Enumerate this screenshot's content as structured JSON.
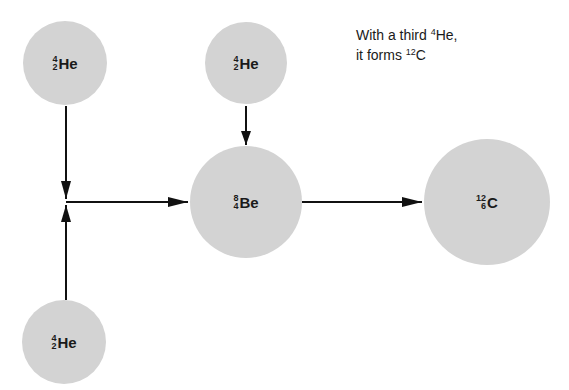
{
  "caption": {
    "line1_prefix": "With a third ",
    "line1_mass": "4",
    "line1_symbol": "He,",
    "line2_prefix": "it forms ",
    "line2_mass": "12",
    "line2_symbol": "C"
  },
  "nodes": [
    {
      "id": "he-top-left",
      "mass": "4",
      "atomic": "2",
      "symbol": "He"
    },
    {
      "id": "he-top-middle",
      "mass": "4",
      "atomic": "2",
      "symbol": "He"
    },
    {
      "id": "he-bottom-left",
      "mass": "4",
      "atomic": "2",
      "symbol": "He"
    },
    {
      "id": "be",
      "mass": "8",
      "atomic": "4",
      "symbol": "Be"
    },
    {
      "id": "c",
      "mass": "12",
      "atomic": "6",
      "symbol": "C"
    }
  ],
  "edges": [
    {
      "from": "he-top-left",
      "to": "junction"
    },
    {
      "from": "he-bottom-left",
      "to": "junction"
    },
    {
      "from": "junction",
      "to": "be"
    },
    {
      "from": "he-top-middle",
      "to": "be"
    },
    {
      "from": "be",
      "to": "c"
    }
  ],
  "colors": {
    "nucleus_fill": "#d3d3d3",
    "arrow": "#111111",
    "text": "#1a1a1a"
  }
}
